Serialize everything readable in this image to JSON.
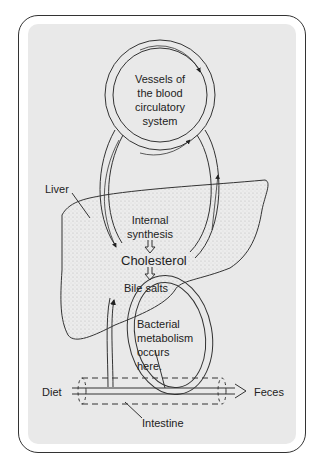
{
  "figure": {
    "type": "cholesterol enterohepatic circulation diagram",
    "labels": {
      "vessels": [
        "Vessels of",
        "the blood",
        "circulatory",
        "system"
      ],
      "liver": "Liver",
      "internal_synthesis": [
        "Internal",
        "synthesis"
      ],
      "cholesterol": "Cholesterol",
      "bile_salts": "Bile salts",
      "bacterial": [
        "Bacterial",
        "metabolism",
        "occurs",
        "here."
      ],
      "diet": "Diet",
      "feces": "Feces",
      "intestine": "Intestine"
    },
    "colors": {
      "panel": "#e9e9e9",
      "ink": "#222222",
      "liver_stipple": "#555555"
    }
  }
}
